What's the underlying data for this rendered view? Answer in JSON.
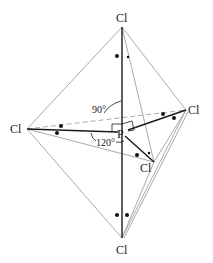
{
  "central_atom": {
    "label": "P",
    "x": 122,
    "y": 133
  },
  "atoms": [
    {
      "id": "axial-top",
      "label": "Cl",
      "x": 122,
      "y": 18,
      "lx": 116,
      "ly": 22
    },
    {
      "id": "axial-bottom",
      "label": "Cl",
      "x": 122,
      "y": 248,
      "lx": 116,
      "ly": 253
    },
    {
      "id": "equatorial-left",
      "label": "Cl",
      "x": 25,
      "y": 129,
      "lx": 10,
      "ly": 133
    },
    {
      "id": "equatorial-right",
      "label": "Cl",
      "x": 186,
      "y": 110,
      "lx": 188,
      "ly": 114
    },
    {
      "id": "equatorial-front",
      "label": "Cl",
      "x": 154,
      "y": 162,
      "lx": 140,
      "ly": 172
    }
  ],
  "angles": [
    {
      "id": "angle-90",
      "label": "90°",
      "x": 93,
      "y": 113
    },
    {
      "id": "angle-120",
      "label": "120°",
      "x": 97,
      "y": 145
    }
  ],
  "colors": {
    "bond": "#1a1a1a",
    "edge": "#9a9a9a",
    "dashed": "#9a9a9a",
    "dot": "#111111"
  }
}
